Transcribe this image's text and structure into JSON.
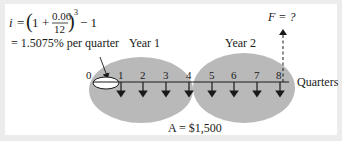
{
  "formula": {
    "lhs": "i",
    "equals": "=",
    "open_paren": "(",
    "one": "1",
    "plus": "+",
    "numerator": "0.06",
    "denominator": "12",
    "close_paren": ")",
    "exponent": "3",
    "minus_one": "− 1",
    "result": "= 1.5075% per quarter"
  },
  "labels": {
    "year1": "Year 1",
    "year2": "Year 2",
    "future_value": "F = ?",
    "axis_unit": "Quarters",
    "payment": "A = $1,500"
  },
  "timeline": {
    "ticks": [
      "0",
      "1",
      "2",
      "3",
      "4",
      "5",
      "6",
      "7",
      "8"
    ],
    "payment_periods": [
      "1",
      "2",
      "3",
      "4",
      "5",
      "6",
      "7",
      "8"
    ],
    "future_value_at": "8"
  },
  "colors": {
    "ellipse_fill": "#b9b9b9",
    "background_border": "#ececec",
    "panel": "#ffffff",
    "ink": "#1a1a1a"
  }
}
